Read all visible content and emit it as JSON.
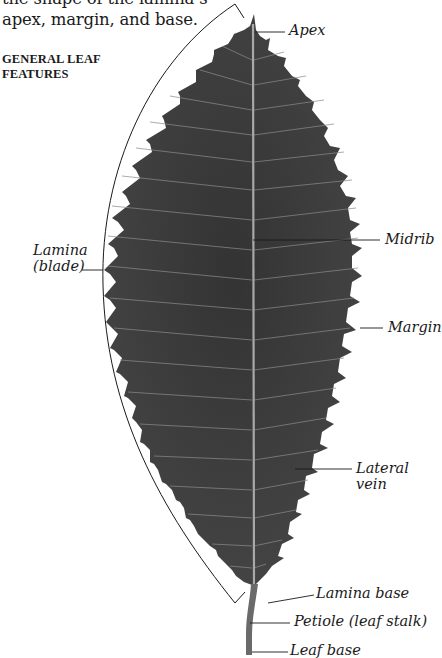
{
  "intro": {
    "line1": "the shape of the lamina’s",
    "line2": "apex, margin, and base."
  },
  "heading": {
    "line1": "GENERAL LEAF",
    "line2": "FEATURES"
  },
  "labels": {
    "apex": "Apex",
    "midrib": "Midrib",
    "lamina_line1": "Lamina",
    "lamina_line2": "(blade)",
    "margin": "Margin",
    "lateral_vein_line1": "Lateral",
    "lateral_vein_line2": "vein",
    "lamina_base": "Lamina base",
    "petiole": "Petiole (leaf stalk)",
    "leaf_base": "Leaf base"
  },
  "colors": {
    "leaf": "#3a3a3a",
    "vein": "#9a9a9a",
    "line": "#1a1a1a"
  }
}
